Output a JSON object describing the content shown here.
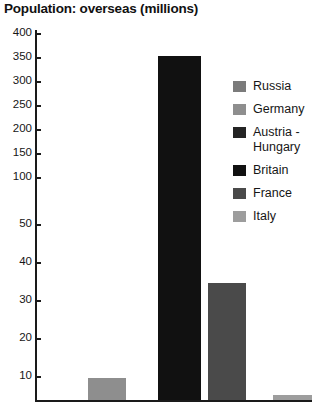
{
  "chart_data": {
    "type": "bar",
    "title": "Population: overseas (millions)",
    "xlabel": "",
    "ylabel": "",
    "categories": [
      "Russia",
      "Germany",
      "Austria - Hungary",
      "Britain",
      "France",
      "Italy"
    ],
    "values": [
      0,
      11,
      0,
      360,
      34,
      1.5
    ],
    "series": [
      {
        "name": "Population: overseas (millions)",
        "values": [
          0,
          11,
          0,
          360,
          34,
          1.5
        ]
      }
    ],
    "colors": [
      "#7b7b7b",
      "#8e8e8e",
      "#242424",
      "#111111",
      "#4a4a4a",
      "#9d9d9d"
    ],
    "ytick_labels": [
      "400",
      "350",
      "300",
      "250",
      "200",
      "150",
      "100",
      "50",
      "40",
      "30",
      "20",
      "10"
    ],
    "ytick_values": [
      400,
      350,
      300,
      250,
      200,
      150,
      100,
      50,
      40,
      30,
      20,
      10
    ],
    "ytick_positions_px": [
      33,
      57,
      81,
      105,
      129,
      153,
      177,
      224,
      262,
      300,
      338,
      376
    ],
    "ylim": [
      0,
      400
    ],
    "axis_note": "broken non-linear y-axis: 400-100 evenly spaced, then 50,40,30,20,10",
    "grid": false,
    "legend_position": "inside-right"
  },
  "legend": {
    "entries": [
      {
        "label": "Russia",
        "color": "#7b7b7b"
      },
      {
        "label": "Germany",
        "color": "#8e8e8e"
      },
      {
        "label": "Austria -\nHungary",
        "color": "#242424"
      },
      {
        "label": "Britain",
        "color": "#111111"
      },
      {
        "label": "France",
        "color": "#4a4a4a"
      },
      {
        "label": "Italy",
        "color": "#9d9d9d"
      }
    ]
  },
  "bars_layout": [
    {
      "name": "Russia",
      "left_px": 0,
      "width_px": 0,
      "height_px": 0,
      "color": "#7b7b7b"
    },
    {
      "name": "Germany",
      "left_px": 52,
      "width_px": 38,
      "height_px": 22,
      "color": "#8e8e8e"
    },
    {
      "name": "Austria - Hungary",
      "left_px": 0,
      "width_px": 0,
      "height_px": 0,
      "color": "#242424"
    },
    {
      "name": "Britain",
      "left_px": 122,
      "width_px": 43,
      "height_px": 344,
      "color": "#111111"
    },
    {
      "name": "France",
      "left_px": 172,
      "width_px": 38,
      "height_px": 117,
      "color": "#4a4a4a"
    },
    {
      "name": "Italy",
      "left_px": 237,
      "width_px": 39,
      "height_px": 5,
      "color": "#9d9d9d"
    }
  ]
}
